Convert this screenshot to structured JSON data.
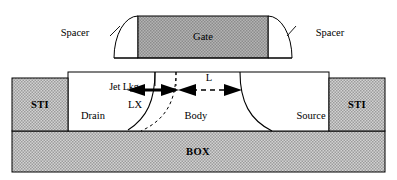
{
  "figure": {
    "colors": {
      "outline": "#000000",
      "hatch_fill": "#c8c8c8",
      "hatch_line": "#707070",
      "gate_fill": "#a8a8a8",
      "gate_dot": "#555555",
      "silicon_fill": "#ffffff",
      "background": "#ffffff"
    }
  },
  "labels": {
    "spacer_left": "Spacer",
    "spacer_right": "Spacer",
    "gate": "Gate",
    "sti_left": "STI",
    "sti_right": "STI",
    "drain": "Drain",
    "body": "Body",
    "source": "Source",
    "box": "BOX",
    "jet_lkg": "Jet Lkg",
    "lx": "LX",
    "l": "L"
  },
  "dimensions": {
    "lx_arrow": "LX",
    "l_arrow": "L"
  }
}
